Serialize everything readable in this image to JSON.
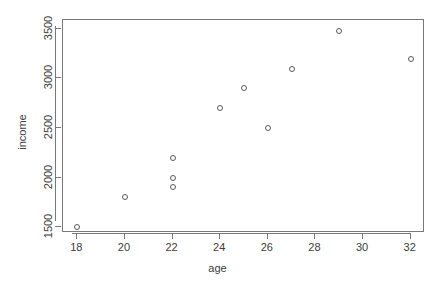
{
  "chart_data": {
    "type": "scatter",
    "title": "",
    "xlabel": "age",
    "ylabel": "income",
    "xlim": [
      17.4,
      32.6
    ],
    "ylim": [
      1440,
      3590
    ],
    "grid": false,
    "legend": null,
    "xticks": [
      18,
      20,
      22,
      24,
      26,
      28,
      30,
      32
    ],
    "xtick_labels": [
      "18",
      "20",
      "22",
      "24",
      "26",
      "28",
      "30",
      "32"
    ],
    "yticks": [
      1500,
      2000,
      2500,
      3000,
      3500
    ],
    "ytick_labels": [
      "1500",
      "2000",
      "2500",
      "3000",
      "3500"
    ],
    "marker": "open-circle",
    "marker_color": "#5a5a5a",
    "points": [
      {
        "x": 18,
        "y": 1500
      },
      {
        "x": 20,
        "y": 1800
      },
      {
        "x": 22,
        "y": 1900
      },
      {
        "x": 22,
        "y": 2000
      },
      {
        "x": 22,
        "y": 2200
      },
      {
        "x": 24,
        "y": 2700
      },
      {
        "x": 25,
        "y": 2900
      },
      {
        "x": 26,
        "y": 2500
      },
      {
        "x": 27,
        "y": 3100
      },
      {
        "x": 29,
        "y": 3480
      },
      {
        "x": 32,
        "y": 3200
      }
    ]
  }
}
